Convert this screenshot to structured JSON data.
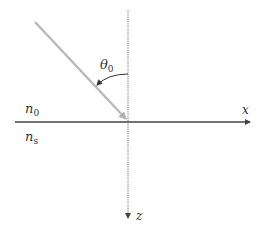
{
  "diagram": {
    "colors": {
      "ray": "#b8b8b8",
      "axis": "#444444",
      "normal": "#666666",
      "arc": "#333333",
      "text": "#333333"
    },
    "labels": {
      "theta": "θ",
      "theta_sub": "0",
      "n_top": "n",
      "n_top_sub": "0",
      "n_bottom": "n",
      "n_bottom_sub": "s",
      "x_axis": "x",
      "z_axis": "z"
    },
    "elements": {
      "incident_ray": {
        "from": [
          35,
          22
        ],
        "to": [
          127,
          120
        ]
      },
      "interface_axis": {
        "from": [
          15,
          122
        ],
        "to": [
          250,
          122
        ]
      },
      "normal_axis": {
        "from": [
          128,
          10
        ],
        "to": [
          128,
          220
        ]
      },
      "angle_arc": {
        "from": [
          128,
          74
        ],
        "to": [
          96,
          86
        ]
      }
    }
  }
}
